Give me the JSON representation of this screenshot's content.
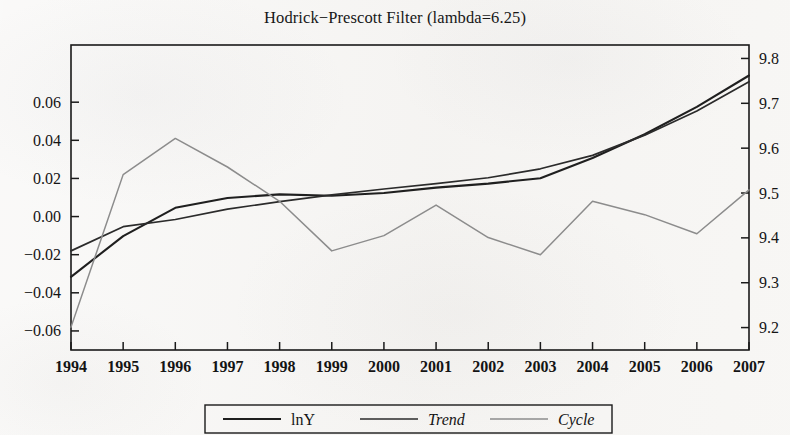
{
  "title": "Hodrick−Prescott Filter (lambda=6.25)",
  "legend": {
    "items": [
      {
        "label": "lnY",
        "italic": false,
        "color": "#1f1f1f",
        "width": 2.1
      },
      {
        "label": "Trend",
        "italic": true,
        "color": "#2b2b2b",
        "width": 1.7
      },
      {
        "label": "Cycle",
        "italic": true,
        "color": "#8c8c8c",
        "width": 1.5
      }
    ]
  },
  "axes": {
    "x_ticks": [
      "1994",
      "1995",
      "1996",
      "1997",
      "1998",
      "1999",
      "2000",
      "2001",
      "2002",
      "2003",
      "2004",
      "2005",
      "2006",
      "2007"
    ],
    "left_ticks": [
      "0.06",
      "0.04",
      "0.02",
      "0.00",
      "−0.02",
      "−0.04",
      "−0.06"
    ],
    "right_ticks": [
      "9.8",
      "9.7",
      "9.6",
      "9.5",
      "9.4",
      "9.3",
      "9.2"
    ],
    "left_label": "",
    "right_label": "",
    "x_label": ""
  },
  "chart_data": {
    "type": "line",
    "title": "Hodrick−Prescott Filter (lambda=6.25)",
    "xlabel": "",
    "ylabel": "",
    "grid": false,
    "legend_position": "bottom",
    "x": [
      1994,
      1995,
      1996,
      1997,
      1998,
      1999,
      2000,
      2001,
      2002,
      2003,
      2004,
      2005,
      2006,
      2007
    ],
    "left_axis": {
      "label": "",
      "ticks": [
        0.06,
        0.04,
        0.02,
        0.0,
        -0.02,
        -0.04,
        -0.06
      ],
      "ylim": [
        -0.07,
        0.09
      ]
    },
    "right_axis": {
      "label": "",
      "ticks": [
        9.8,
        9.7,
        9.6,
        9.5,
        9.4,
        9.3,
        9.2
      ],
      "ylim": [
        9.15,
        9.83
      ]
    },
    "series": [
      {
        "name": "lnY",
        "axis": "right",
        "color": "#1f1f1f",
        "values": [
          9.313,
          9.404,
          9.467,
          9.489,
          9.497,
          9.494,
          9.5,
          9.512,
          9.521,
          9.533,
          9.578,
          9.631,
          9.692,
          9.762
        ]
      },
      {
        "name": "Trend",
        "axis": "right",
        "color": "#2b2b2b",
        "values": [
          9.371,
          9.425,
          9.441,
          9.464,
          9.481,
          9.496,
          9.509,
          9.521,
          9.534,
          9.554,
          9.584,
          9.629,
          9.683,
          9.748
        ]
      },
      {
        "name": "Cycle",
        "axis": "left",
        "color": "#8c8c8c",
        "values": [
          -0.058,
          0.022,
          0.041,
          0.026,
          0.008,
          -0.018,
          -0.01,
          0.006,
          -0.011,
          -0.02,
          0.008,
          0.001,
          -0.009,
          0.014
        ]
      }
    ]
  }
}
